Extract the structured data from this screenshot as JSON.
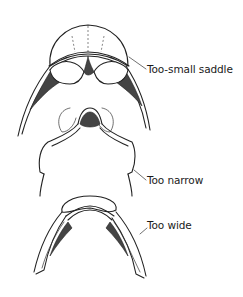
{
  "figure": {
    "background": "#ffffff",
    "line_color": "#222222",
    "diagrams": [
      {
        "id": "too-small-saddle",
        "label": "Too-small saddle"
      },
      {
        "id": "too-narrow",
        "label": "Too narrow"
      },
      {
        "id": "too-wide",
        "label": "Too wide"
      }
    ]
  }
}
